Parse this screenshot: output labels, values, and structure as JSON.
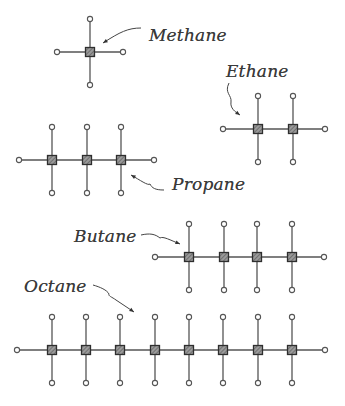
{
  "diagram": {
    "title": "",
    "style": {
      "bond_color": "#555555",
      "carbon_fill": "#8a8a8a",
      "carbon_border": "#2e2e2e",
      "hydrogen_fill": "#ffffff",
      "hydrogen_border": "#555555",
      "label_color": "#3a3a3a",
      "background": "#ffffff"
    },
    "molecules": [
      {
        "name": "Methane",
        "label": "Methane",
        "carbon_count": 1,
        "carbons_x": [
          90
        ],
        "y": 52,
        "bond_length": 33,
        "end_left_x": 57,
        "end_right_x": 123,
        "label_pos": {
          "x": 149,
          "y": 27
        },
        "arrow": {
          "path": "M141 28 C 128 28, 120 32, 103 43"
        }
      },
      {
        "name": "Ethane",
        "label": "Ethane",
        "carbon_count": 2,
        "carbons_x": [
          258,
          293
        ],
        "y": 129,
        "bond_length": 33,
        "end_left_x": 223,
        "end_right_x": 325,
        "label_pos": {
          "x": 226,
          "y": 63
        },
        "arrow": {
          "path": "M229 83 C 224 93, 232 95, 231 102 C 230 108, 235 112, 240 115"
        }
      },
      {
        "name": "Propane",
        "label": "Propane",
        "carbon_count": 3,
        "carbons_x": [
          52,
          87,
          121
        ],
        "y": 160,
        "bond_length": 33,
        "end_left_x": 19,
        "end_right_x": 154,
        "label_pos": {
          "x": 172,
          "y": 176
        },
        "arrow": {
          "path": "M164 190 C 155 190, 152 188, 150 184 C 148 186, 140 180, 131 175"
        }
      },
      {
        "name": "Butane",
        "label": "Butane",
        "carbon_count": 4,
        "carbons_x": [
          189,
          224,
          257,
          292
        ],
        "y": 257,
        "bond_length": 33,
        "end_left_x": 155,
        "end_right_x": 324,
        "label_pos": {
          "x": 74,
          "y": 228
        },
        "arrow": {
          "path": "M141 235 C 150 233, 155 234, 160 238 C 163 236, 170 240, 180 244"
        }
      },
      {
        "name": "Octane",
        "label": "Octane",
        "carbon_count": 8,
        "carbons_x": [
          52,
          86,
          120,
          155,
          189,
          223,
          258,
          292
        ],
        "y": 350,
        "bond_length": 33,
        "end_left_x": 17,
        "end_right_x": 325,
        "label_pos": {
          "x": 24,
          "y": 278
        },
        "arrow": {
          "path": "M93 285 C 100 287, 107 290, 109 294 C 108 296, 112 297, 116 300 C 122 304, 128 308, 134 312"
        }
      }
    ]
  }
}
